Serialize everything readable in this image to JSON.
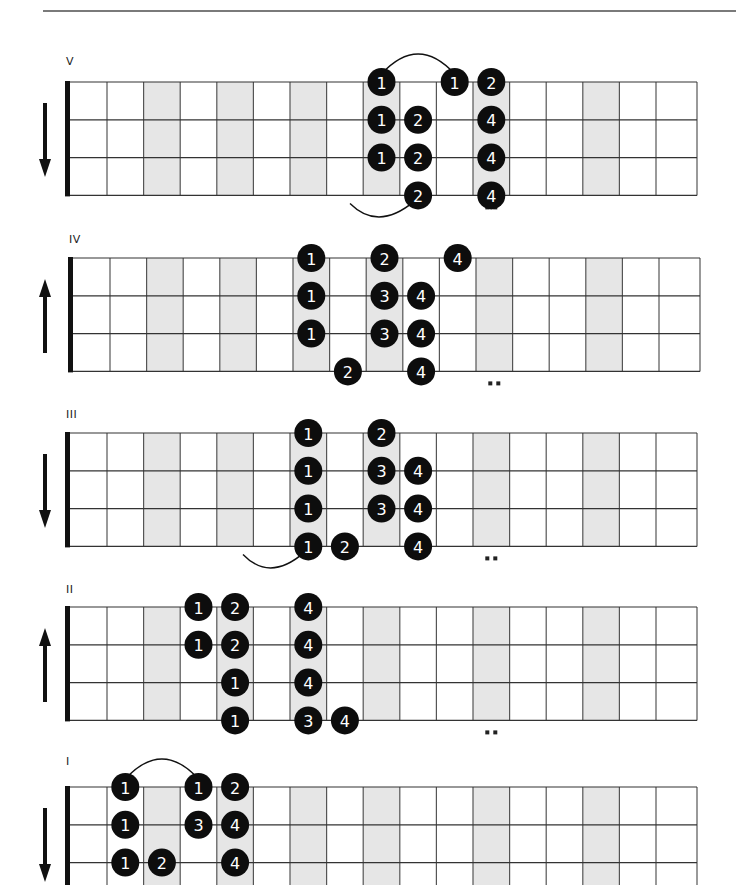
{
  "page": {
    "colors": {
      "ink": "#111111",
      "grid": "#555555",
      "shade": "#e6e6e6",
      "note_fill": "#0d0d0d",
      "note_text": "#ffffff",
      "rule": "#7a7a7a"
    }
  },
  "fretboard": {
    "strings": 4,
    "frets": 17,
    "shaded_frets": [
      3,
      5,
      7,
      9,
      12,
      15
    ],
    "double_dot_fret": 12
  },
  "diagrams": [
    {
      "label": "V",
      "direction": "down",
      "label_y": 55,
      "top": 82,
      "x_shift": 0,
      "show_double_dots": true,
      "visible_strings": 4,
      "notes": [
        {
          "fret": 9,
          "string": 1,
          "finger": "1"
        },
        {
          "fret": 9,
          "string": 2,
          "finger": "1"
        },
        {
          "fret": 9,
          "string": 3,
          "finger": "1"
        },
        {
          "fret": 10,
          "string": 2,
          "finger": "2"
        },
        {
          "fret": 10,
          "string": 3,
          "finger": "2"
        },
        {
          "fret": 10,
          "string": 4,
          "finger": "2"
        },
        {
          "fret": 11,
          "string": 1,
          "finger": "1"
        },
        {
          "fret": 12,
          "string": 1,
          "finger": "2"
        },
        {
          "fret": 12,
          "string": 2,
          "finger": "4"
        },
        {
          "fret": 12,
          "string": 3,
          "finger": "4"
        },
        {
          "fret": 12,
          "string": 4,
          "finger": "4"
        }
      ],
      "slides": [
        {
          "type": "over",
          "from_fret": 9,
          "to_fret": 11,
          "string": 1
        },
        {
          "type": "under-in",
          "from_x": 350,
          "to_fret": 10,
          "string": 4
        }
      ]
    },
    {
      "label": "IV",
      "direction": "up",
      "label_y": 233,
      "top": 258,
      "x_shift": 3,
      "show_double_dots": true,
      "visible_strings": 4,
      "notes": [
        {
          "fret": 7,
          "string": 1,
          "finger": "1"
        },
        {
          "fret": 7,
          "string": 2,
          "finger": "1"
        },
        {
          "fret": 7,
          "string": 3,
          "finger": "1"
        },
        {
          "fret": 8,
          "string": 4,
          "finger": "2"
        },
        {
          "fret": 9,
          "string": 1,
          "finger": "2"
        },
        {
          "fret": 9,
          "string": 2,
          "finger": "3"
        },
        {
          "fret": 9,
          "string": 3,
          "finger": "3"
        },
        {
          "fret": 10,
          "string": 2,
          "finger": "4"
        },
        {
          "fret": 10,
          "string": 3,
          "finger": "4"
        },
        {
          "fret": 10,
          "string": 4,
          "finger": "4"
        },
        {
          "fret": 11,
          "string": 1,
          "finger": "4"
        }
      ],
      "slides": []
    },
    {
      "label": "III",
      "direction": "down",
      "label_y": 408,
      "top": 433,
      "x_shift": 0,
      "show_double_dots": true,
      "visible_strings": 4,
      "notes": [
        {
          "fret": 7,
          "string": 1,
          "finger": "1"
        },
        {
          "fret": 7,
          "string": 2,
          "finger": "1"
        },
        {
          "fret": 7,
          "string": 3,
          "finger": "1"
        },
        {
          "fret": 7,
          "string": 4,
          "finger": "1"
        },
        {
          "fret": 8,
          "string": 4,
          "finger": "2"
        },
        {
          "fret": 9,
          "string": 1,
          "finger": "2"
        },
        {
          "fret": 9,
          "string": 2,
          "finger": "3"
        },
        {
          "fret": 9,
          "string": 3,
          "finger": "3"
        },
        {
          "fret": 10,
          "string": 2,
          "finger": "4"
        },
        {
          "fret": 10,
          "string": 3,
          "finger": "4"
        },
        {
          "fret": 10,
          "string": 4,
          "finger": "4"
        }
      ],
      "slides": [
        {
          "type": "under-in",
          "from_x": 243,
          "to_fret": 7,
          "string": 4
        }
      ]
    },
    {
      "label": "II",
      "direction": "up",
      "label_y": 583,
      "top": 607,
      "x_shift": 0,
      "show_double_dots": true,
      "visible_strings": 4,
      "notes": [
        {
          "fret": 4,
          "string": 1,
          "finger": "1"
        },
        {
          "fret": 4,
          "string": 2,
          "finger": "1"
        },
        {
          "fret": 5,
          "string": 1,
          "finger": "2"
        },
        {
          "fret": 5,
          "string": 2,
          "finger": "2"
        },
        {
          "fret": 5,
          "string": 3,
          "finger": "1"
        },
        {
          "fret": 5,
          "string": 4,
          "finger": "1"
        },
        {
          "fret": 7,
          "string": 1,
          "finger": "4"
        },
        {
          "fret": 7,
          "string": 2,
          "finger": "4"
        },
        {
          "fret": 7,
          "string": 3,
          "finger": "4"
        },
        {
          "fret": 7,
          "string": 4,
          "finger": "3"
        },
        {
          "fret": 8,
          "string": 4,
          "finger": "4"
        }
      ],
      "slides": []
    },
    {
      "label": "I",
      "direction": "down",
      "label_y": 755,
      "top": 787,
      "x_shift": 0,
      "show_double_dots": false,
      "visible_strings": 4,
      "notes": [
        {
          "fret": 2,
          "string": 1,
          "finger": "1"
        },
        {
          "fret": 2,
          "string": 2,
          "finger": "1"
        },
        {
          "fret": 2,
          "string": 3,
          "finger": "1"
        },
        {
          "fret": 3,
          "string": 3,
          "finger": "2"
        },
        {
          "fret": 4,
          "string": 1,
          "finger": "1"
        },
        {
          "fret": 4,
          "string": 2,
          "finger": "3"
        },
        {
          "fret": 5,
          "string": 1,
          "finger": "2"
        },
        {
          "fret": 5,
          "string": 2,
          "finger": "4"
        },
        {
          "fret": 5,
          "string": 3,
          "finger": "4"
        }
      ],
      "slides": [
        {
          "type": "over",
          "from_fret": 2,
          "to_fret": 4,
          "string": 1
        }
      ]
    }
  ]
}
